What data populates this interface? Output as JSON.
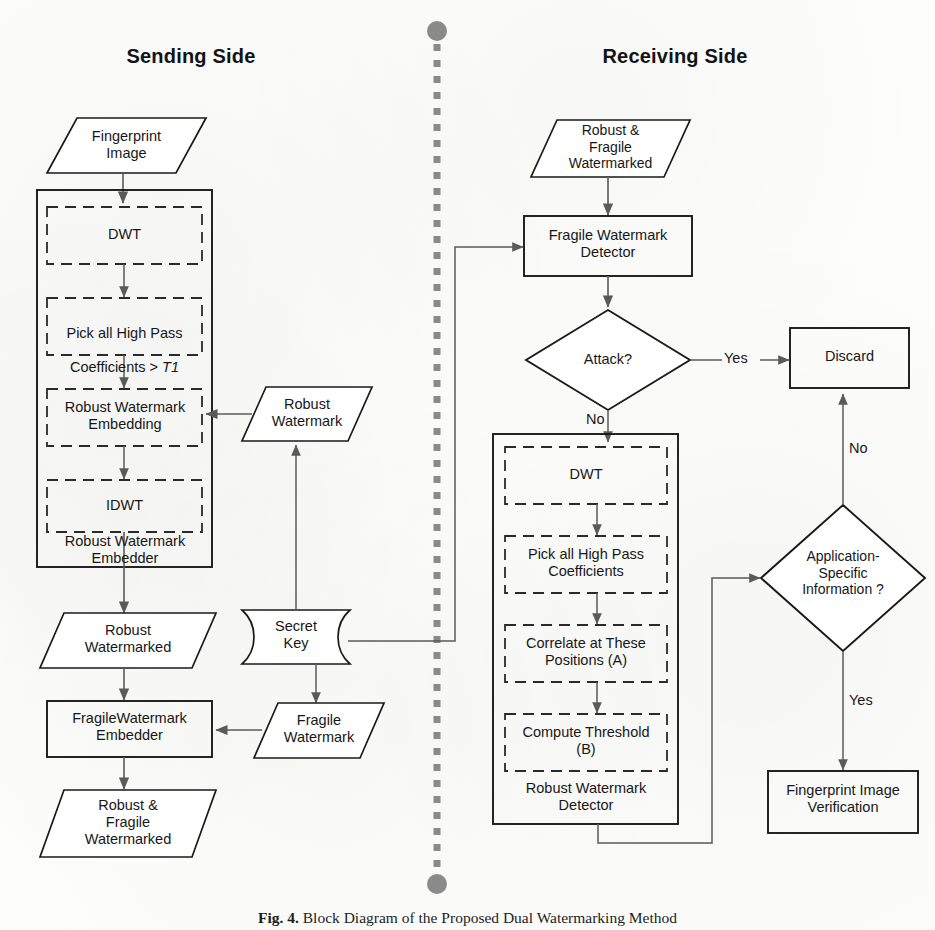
{
  "figure": {
    "caption_label": "Fig. 4.",
    "caption_text": "Block Diagram of the Proposed Dual Watermarking Method",
    "divider_icon": "vertical-dashed-divider"
  },
  "colors": {
    "stroke": "#1a1a1a",
    "dashed_stroke": "#2a2a2a",
    "connector": "#4a4a4a",
    "divider": "#7a7a7a",
    "background": "#fdfdfc"
  },
  "sides": {
    "left": {
      "title": "Sending Side"
    },
    "right": {
      "title": "Receiving Side"
    }
  },
  "sending": {
    "input": "Fingerprint\nImage",
    "embedder_group_label": "Robust Watermark\nEmbedder",
    "steps": [
      "DWT",
      "Pick all High Pass\nCoefficients > T1",
      "Robust Watermark\nEmbedding",
      "IDWT"
    ],
    "step2_prefix": "Coefficients > ",
    "step2_italic": "T1",
    "step2_line1": "Pick all High Pass",
    "robust_watermark": "Robust\nWatermark",
    "secret_key": "Secret\nKey",
    "fragile_watermark": "Fragile\nWatermark",
    "robust_watermarked": "Robust\nWatermarked",
    "fragile_embedder": "FragileWatermark\nEmbedder",
    "output": "Robust &\nFragile\nWatermarked"
  },
  "receiving": {
    "input": "Robust &\nFragile\nWatermarked",
    "fragile_detector": "Fragile Watermark\nDetector",
    "attack_decision": "Attack?",
    "discard": "Discard",
    "detector_group_label": "Robust Watermark\nDetector",
    "steps": [
      "DWT",
      "Pick all High Pass\nCoefficients",
      "Correlate at These\nPositions (A)",
      "Compute Threshold\n(B)"
    ],
    "appinfo_decision": "Application-\nSpecific\nInformation ?",
    "verification": "Fingerprint Image\nVerification",
    "labels": {
      "yes_attack": "Yes",
      "no_attack": "No",
      "no_appinfo": "No",
      "yes_appinfo": "Yes"
    }
  }
}
